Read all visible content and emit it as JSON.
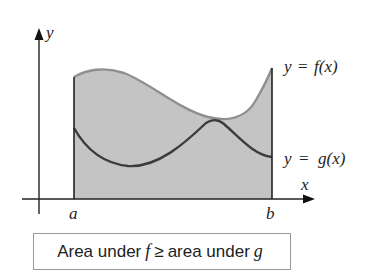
{
  "figure": {
    "y_axis_label": "y",
    "x_axis_label": "x",
    "lower_limit_label": "a",
    "upper_limit_label": "b",
    "f_curve_label": {
      "lhs": "y",
      "eq": "=",
      "rhs": "f(x)"
    },
    "g_curve_label": {
      "lhs": "y",
      "eq": "=",
      "rhs": "g(x)"
    },
    "shaded_region": "area under f from a to b",
    "colors": {
      "shade": "#c4c4c4",
      "f_curve": "#8f8f8f",
      "g_curve": "#3c3c3c",
      "axes": "#222222",
      "caption_border": "#9a9a9a"
    }
  },
  "caption": {
    "prefix": "Area under",
    "f_symbol": "f",
    "relation": "≥",
    "middle": "area under",
    "g_symbol": "g"
  }
}
